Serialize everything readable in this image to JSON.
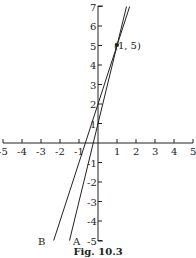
{
  "figure": {
    "caption": "Fig. 10.3",
    "point_label": "(1, 5)",
    "line_labels": {
      "A": "A",
      "B": "B"
    }
  },
  "chart_data": {
    "type": "line",
    "title": "Fig. 10.3",
    "xlabel": "",
    "ylabel": "",
    "xlim": [
      -5,
      5
    ],
    "ylim": [
      -5,
      7
    ],
    "x_ticks": [
      -5,
      -4,
      -3,
      -2,
      -1,
      1,
      2,
      3,
      4,
      5
    ],
    "y_ticks": [
      -5,
      -4,
      -3,
      -2,
      -1,
      1,
      2,
      3,
      4,
      5,
      6,
      7
    ],
    "grid": false,
    "series": [
      {
        "name": "A",
        "equation": "y = 4x + 1",
        "x": [
          -1.5,
          1.5
        ],
        "y": [
          -5,
          7
        ]
      },
      {
        "name": "B",
        "equation": "y = 3x + 2",
        "x": [
          -2.333,
          1.667
        ],
        "y": [
          -5,
          7
        ]
      }
    ],
    "annotations": [
      {
        "text": "(1, 5)",
        "x": 1,
        "y": 5
      }
    ]
  }
}
